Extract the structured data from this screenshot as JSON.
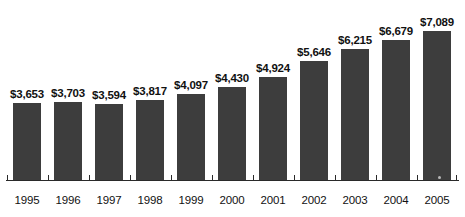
{
  "chart_data": {
    "type": "bar",
    "title": "",
    "subtitle": "",
    "xlabel": "",
    "ylabel": "",
    "categories": [
      "1995",
      "1996",
      "1997",
      "1998",
      "1999",
      "2000",
      "2001",
      "2002",
      "2003",
      "2004",
      "2005"
    ],
    "values": [
      3653,
      3703,
      3594,
      3817,
      4097,
      4430,
      4924,
      5646,
      6215,
      6679,
      7089
    ],
    "value_labels": [
      "$3,653",
      "$3,703",
      "$3,594",
      "$3,817",
      "$4,097",
      "$4,430",
      "$4,924",
      "$5,646",
      "$6,215",
      "$6,679",
      "$7,089"
    ],
    "ylim": [
      0,
      7089
    ],
    "grid": false,
    "legend": false,
    "legend_position": "none",
    "axis": {
      "y_axis_visible": false,
      "y_tick_labels": [],
      "x_axis_visible": true,
      "x_tick_marks_in_gaps": true
    },
    "annotations": [],
    "colors": {
      "bar": "#3d3d3d",
      "background": "#ffffff",
      "text": "#111111",
      "axis": "#2a2a2a"
    }
  }
}
